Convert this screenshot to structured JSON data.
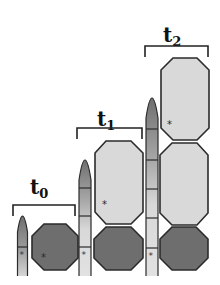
{
  "diagram": {
    "type": "growth-stages",
    "colors": {
      "stroke": "#2b2b2b",
      "dark_cell": "#6e6e6e",
      "light_cell": "#d9d9d9",
      "pillar_tip": "#7a7a7a",
      "pillar_body": "#dcdcdc",
      "marker": "#333333"
    },
    "stages": [
      {
        "id": "t0",
        "label": {
          "main": "t",
          "sub": "0"
        },
        "pillar_segments": 2,
        "cells": [
          {
            "shade": "dark",
            "marker": true
          }
        ]
      },
      {
        "id": "t1",
        "label": {
          "main": "t",
          "sub": "1"
        },
        "pillar_segments": 4,
        "cells": [
          {
            "shade": "light",
            "marker": true
          },
          {
            "shade": "dark",
            "marker": false
          }
        ]
      },
      {
        "id": "t2",
        "label": {
          "main": "t",
          "sub": "2"
        },
        "pillar_segments": 6,
        "cells": [
          {
            "shade": "light",
            "marker": true
          },
          {
            "shade": "light",
            "marker": false
          },
          {
            "shade": "dark",
            "marker": false
          }
        ]
      }
    ],
    "marker_glyph": "*"
  }
}
